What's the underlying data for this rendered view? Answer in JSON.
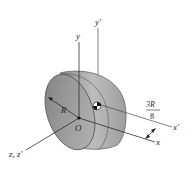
{
  "figure": {
    "labels": {
      "y_axis": "y",
      "y_prime_axis": "y′",
      "x_axis": "x",
      "x_prime_axis": "x′",
      "z_axes": "z, z′",
      "origin": "O",
      "radius": "R",
      "offset_numerator": "3R",
      "offset_denominator": "8"
    },
    "colors": {
      "background": "#ffffff",
      "flat_face": "#8a8a8a",
      "curved_surface": "#a6a6a6",
      "rim": "#5a5a5a",
      "axis_line": "#3a3a3a",
      "text": "#2a2a2a"
    }
  }
}
